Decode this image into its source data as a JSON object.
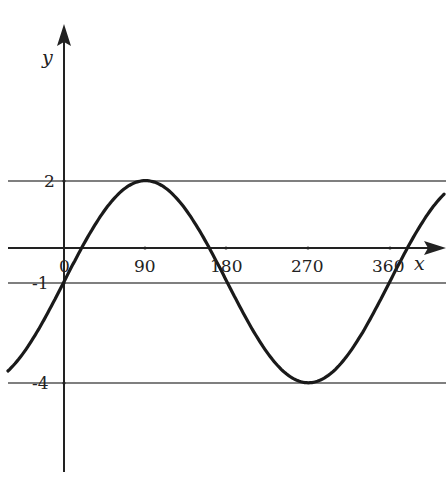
{
  "chart_data": {
    "type": "line",
    "title": "",
    "xlabel": "x",
    "ylabel": "y",
    "function": "y = 3 sin(x) - 1",
    "x_ticks": [
      0,
      90,
      180,
      270,
      360
    ],
    "x_tick_labels": [
      "0",
      "90",
      "180",
      "270",
      "360"
    ],
    "y_reference_lines": [
      2,
      -1,
      -4
    ],
    "y_tick_labels": [
      "2",
      "-1",
      "-4"
    ],
    "xlim": [
      -62,
      420
    ],
    "ylim": [
      -6.4,
      5
    ],
    "grid": false,
    "series": [
      {
        "name": "curve",
        "x": [
          -60,
          -30,
          0,
          30,
          60,
          90,
          120,
          150,
          180,
          210,
          240,
          270,
          300,
          330,
          360,
          390,
          420
        ],
        "values": [
          -3.6,
          -2.5,
          -1,
          0.5,
          1.6,
          2,
          1.6,
          0.5,
          -1,
          -2.5,
          -3.6,
          -4,
          -3.6,
          -2.5,
          -1,
          0.5,
          1.6
        ]
      }
    ]
  },
  "labels": {
    "x_axis": "x",
    "y_axis": "y",
    "tick_0": "0",
    "tick_90": "90",
    "tick_180": "180",
    "tick_270": "270",
    "tick_360": "360",
    "y2": "2",
    "ym1": "-1",
    "ym4": "-4"
  }
}
